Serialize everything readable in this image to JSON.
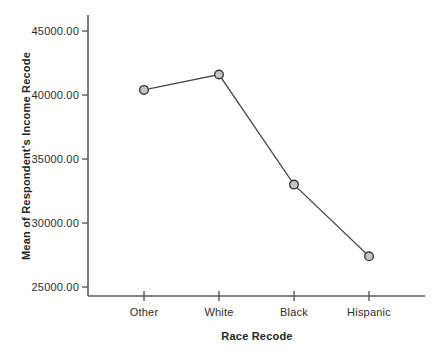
{
  "chart_data": {
    "type": "line",
    "title": "",
    "xlabel": "Race Recode",
    "ylabel": "Mean of Respondent's Income Recode",
    "categories": [
      "Other",
      "White",
      "Black",
      "Hispanic"
    ],
    "series": [
      {
        "name": "Mean of Respondent's Income Recode",
        "values": [
          40400,
          41600,
          33000,
          27400
        ]
      }
    ],
    "y_ticks": [
      25000,
      30000,
      35000,
      40000,
      45000
    ],
    "y_tick_labels": [
      "25000.00",
      "30000.00",
      "35000.00",
      "40000.00",
      "45000.00"
    ],
    "ylim": [
      24300,
      46250
    ],
    "grid": false,
    "legend_position": "none",
    "colors": {
      "background": "#ffffff",
      "axis": "#5a5a5a",
      "line": "#4a4a4a",
      "marker_fill": "#c4c4c4",
      "marker_stroke": "#3a3a3a",
      "text": "#2b2b2b"
    }
  }
}
